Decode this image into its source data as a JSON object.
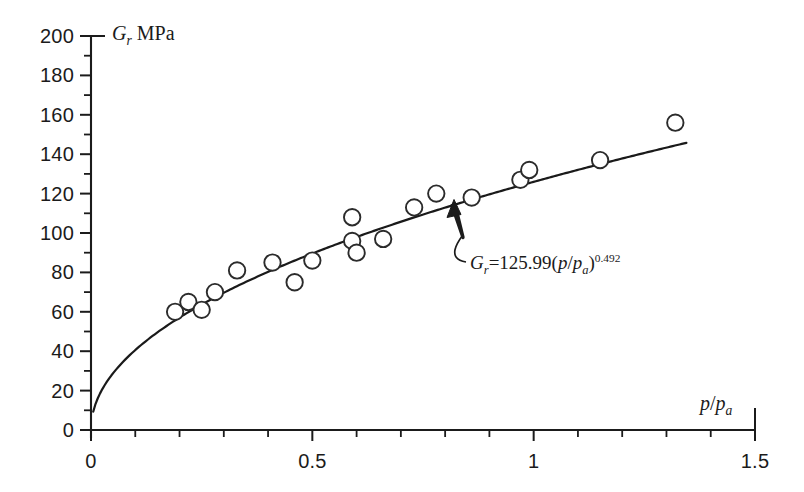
{
  "chart_data": {
    "type": "scatter",
    "title": "",
    "xlabel": "p/p_a",
    "ylabel": "G_r MPa",
    "xlabel_parts": {
      "num": "p",
      "den": "p",
      "den_sub": "a"
    },
    "ylabel_parts": {
      "symbol": "G",
      "subscript": "r",
      "unit": "MPa"
    },
    "xlim": [
      0,
      1.5
    ],
    "ylim": [
      0,
      200
    ],
    "x_major_ticks": [
      0,
      0.5,
      1,
      1.5
    ],
    "x_major_tick_labels": [
      "0",
      "0.5",
      "1",
      "1.5"
    ],
    "x_minor_tick_step": 0.1,
    "y_major_ticks": [
      0,
      20,
      40,
      60,
      80,
      100,
      120,
      140,
      160,
      180,
      200
    ],
    "y_major_tick_labels": [
      "0",
      "20",
      "40",
      "60",
      "80",
      "100",
      "120",
      "140",
      "160",
      "180",
      "200"
    ],
    "y_minor_tick_step": 10,
    "grid": false,
    "legend": null,
    "series": [
      {
        "name": "measured",
        "type": "scatter",
        "marker": "open-circle",
        "marker_color": "#ffffff",
        "marker_edge_color": "#2b2b2b",
        "points": [
          {
            "x": 0.19,
            "y": 60
          },
          {
            "x": 0.22,
            "y": 65
          },
          {
            "x": 0.25,
            "y": 61
          },
          {
            "x": 0.28,
            "y": 70
          },
          {
            "x": 0.33,
            "y": 81
          },
          {
            "x": 0.41,
            "y": 85
          },
          {
            "x": 0.46,
            "y": 75
          },
          {
            "x": 0.5,
            "y": 86
          },
          {
            "x": 0.59,
            "y": 108
          },
          {
            "x": 0.59,
            "y": 96
          },
          {
            "x": 0.6,
            "y": 90
          },
          {
            "x": 0.66,
            "y": 97
          },
          {
            "x": 0.73,
            "y": 113
          },
          {
            "x": 0.78,
            "y": 120
          },
          {
            "x": 0.86,
            "y": 118
          },
          {
            "x": 0.97,
            "y": 127
          },
          {
            "x": 0.99,
            "y": 132
          },
          {
            "x": 1.15,
            "y": 137
          },
          {
            "x": 1.32,
            "y": 156
          }
        ]
      },
      {
        "name": "fitted-power-law",
        "type": "line",
        "line_color": "#1a1a1a",
        "equation": "G_r=125.99(p/p_a)^0.492",
        "coefficient": 125.99,
        "exponent": 0.492,
        "x_range": [
          0.005,
          1.345
        ]
      }
    ],
    "annotations": [
      {
        "name": "fit-equation",
        "text": "G_r=125.99(p/p_a)^0.492",
        "parts": {
          "lhs_symbol": "G",
          "lhs_sub": "r",
          "equals": "=",
          "coefficient": "125.99",
          "open_paren": "(",
          "num": "p",
          "slash": "/",
          "den": "p",
          "den_sub": "a",
          "close_paren": ")",
          "exponent": "0.492"
        },
        "target_point": {
          "x": 0.82,
          "y": 115
        }
      }
    ]
  },
  "labels": {
    "y_axis_title_symbol": "G",
    "y_axis_title_sub": "r",
    "y_axis_title_unit": "MPa",
    "x_axis_title_num": "p",
    "x_axis_title_den": "p",
    "x_axis_title_den_sub": "a"
  }
}
